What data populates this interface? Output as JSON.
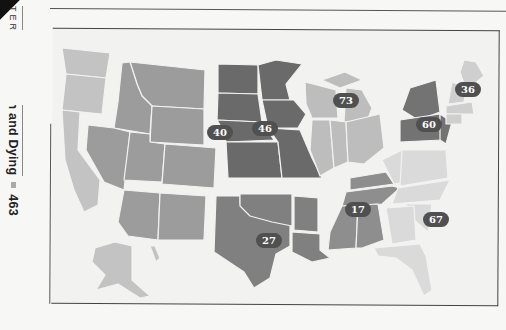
{
  "page": {
    "running_head": {
      "chapter": "TER 15",
      "title": "Death and Dying",
      "page_number": "463"
    }
  },
  "map": {
    "type": "choropleth",
    "subject": "United States by census region",
    "regions": [
      {
        "id": "pacific",
        "states": [
          "WA",
          "OR",
          "CA",
          "AK",
          "HI"
        ],
        "value": null,
        "fill": "#c3c3c3"
      },
      {
        "id": "mountain",
        "states": [
          "MT",
          "ID",
          "WY",
          "NV",
          "UT",
          "CO",
          "AZ",
          "NM"
        ],
        "value": "40",
        "fill": "#9c9c9c"
      },
      {
        "id": "west-north-central",
        "states": [
          "ND",
          "SD",
          "NE",
          "KS",
          "MN",
          "IA",
          "MO"
        ],
        "value": "46",
        "fill": "#6a6a6a"
      },
      {
        "id": "east-north-central",
        "states": [
          "WI",
          "MI",
          "IL",
          "IN",
          "OH"
        ],
        "value": "73",
        "fill": "#bdbdbd"
      },
      {
        "id": "middle-atlantic",
        "states": [
          "NY",
          "PA",
          "NJ"
        ],
        "value": "60",
        "fill": "#737373"
      },
      {
        "id": "new-england",
        "states": [
          "ME",
          "NH",
          "VT",
          "MA",
          "CT",
          "RI"
        ],
        "value": "36",
        "fill": "#cfcfcf"
      },
      {
        "id": "west-south-central",
        "states": [
          "TX",
          "OK",
          "AR",
          "LA"
        ],
        "value": "27",
        "fill": "#808080"
      },
      {
        "id": "east-south-central",
        "states": [
          "KY",
          "TN",
          "MS",
          "AL"
        ],
        "value": "17",
        "fill": "#8e8e8e"
      },
      {
        "id": "south-atlantic",
        "states": [
          "WV",
          "VA",
          "NC",
          "SC",
          "GA",
          "FL",
          "DE",
          "MD"
        ],
        "value": "67",
        "fill": "#dadada"
      }
    ],
    "labels": {
      "mountain": "40",
      "west_north_central": "46",
      "east_north_central": "73",
      "middle_atlantic": "60",
      "new_england": "36",
      "west_south_central": "27",
      "east_south_central": "17",
      "south_atlantic": "67"
    }
  }
}
